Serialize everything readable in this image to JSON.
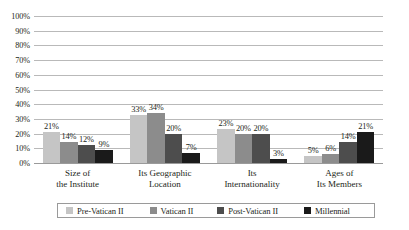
{
  "chart_data": {
    "type": "bar",
    "title": "",
    "subtitle": "",
    "xlabel": "",
    "ylabel": "",
    "ylim": [
      0,
      100
    ],
    "yticks": [
      "0%",
      "10%",
      "20%",
      "30%",
      "40%",
      "50%",
      "60%",
      "70%",
      "80%",
      "90%",
      "100%"
    ],
    "ytick_values": [
      0,
      10,
      20,
      30,
      40,
      50,
      60,
      70,
      80,
      90,
      100
    ],
    "grid": "horizontal",
    "legend_position": "bottom",
    "value_suffix": "%",
    "categories": [
      {
        "line1": "Size of",
        "line2": "the Institute"
      },
      {
        "line1": "Its Geographic",
        "line2": "Location"
      },
      {
        "line1": "Its",
        "line2": "Internationality"
      },
      {
        "line1": "Ages of",
        "line2": "Its Members"
      }
    ],
    "category_labels": [
      "Size of the Institute",
      "Its Geographic Location",
      "Its Internationality",
      "Ages of Its Members"
    ],
    "series": [
      {
        "name": "Pre-Vatican II",
        "color": "#c5c5c5",
        "values": [
          21,
          33,
          23,
          5
        ],
        "labels": [
          "21%",
          "33%",
          "23%",
          "5%"
        ]
      },
      {
        "name": "Vatican II",
        "color": "#8c8c8c",
        "values": [
          14,
          34,
          20,
          6
        ],
        "labels": [
          "14%",
          "34%",
          "20%",
          "6%"
        ]
      },
      {
        "name": "Post-Vatican II",
        "color": "#4d4d4d",
        "values": [
          12,
          20,
          20,
          14
        ],
        "labels": [
          "12%",
          "20%",
          "20%",
          "14%"
        ]
      },
      {
        "name": "Millennial",
        "color": "#1a1a1a",
        "values": [
          9,
          7,
          3,
          21
        ],
        "labels": [
          "9%",
          "7%",
          "3%",
          "21%"
        ]
      }
    ]
  }
}
